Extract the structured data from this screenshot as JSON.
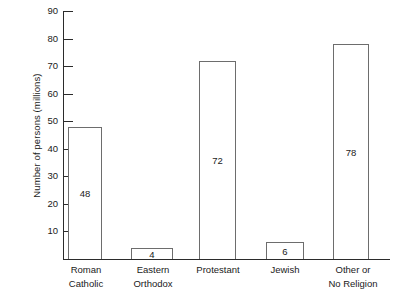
{
  "chart_data": {
    "type": "bar",
    "title": "",
    "xlabel": "",
    "ylabel": "Number of persons (millions)",
    "categories": [
      "Roman Catholic",
      "Eastern Orthodox",
      "Protestant",
      "Jewish",
      "Other or No Religion"
    ],
    "category_lines": [
      [
        "Roman",
        "Catholic"
      ],
      [
        "Eastern",
        "Orthodox"
      ],
      [
        "Protestant",
        ""
      ],
      [
        "Jewish",
        ""
      ],
      [
        "Other or",
        "No Religion"
      ]
    ],
    "values": [
      48,
      4,
      72,
      6,
      78
    ],
    "value_labels": [
      "48",
      "4",
      "72",
      "6",
      "78"
    ],
    "ylim": [
      0,
      90
    ],
    "yticks": [
      10,
      20,
      30,
      40,
      50,
      60,
      70,
      80,
      90
    ],
    "ytick_labels": [
      "10",
      "20",
      "30",
      "40",
      "50",
      "60",
      "70",
      "80",
      "90"
    ],
    "grid": false,
    "legend": false,
    "bar_face_color": "#ffffff",
    "bar_edge_color": "#6d6d6d",
    "axis_color": "#2b2b2b",
    "background_color": "#ffffff"
  }
}
